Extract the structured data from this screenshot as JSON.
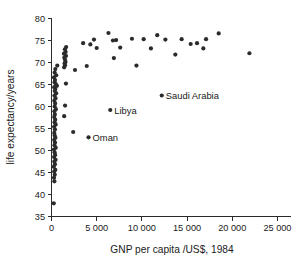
{
  "chart_data": {
    "type": "scatter",
    "title": "",
    "xlabel": "GNP per capita /US$, 1984",
    "ylabel": "life expectancy/years",
    "xlim": [
      0,
      26500
    ],
    "ylim": [
      35,
      80
    ],
    "grid": false,
    "legend": null,
    "xticks": [
      0,
      5000,
      10000,
      15000,
      20000,
      25000
    ],
    "xticklabels": [
      "0",
      "5 000",
      "10 000",
      "15 000",
      "20 000",
      "25 000"
    ],
    "yticks": [
      35,
      40,
      45,
      50,
      55,
      60,
      65,
      70,
      75,
      80
    ],
    "yticklabels": [
      "35",
      "40",
      "45",
      "50",
      "55",
      "60",
      "65",
      "70",
      "75",
      "80"
    ],
    "marker_color": "#2b2b2b",
    "marker_size": 2.1,
    "points": [
      {
        "x": 250,
        "y": 38.0
      },
      {
        "x": 320,
        "y": 43.0
      },
      {
        "x": 280,
        "y": 43.8
      },
      {
        "x": 360,
        "y": 44.5
      },
      {
        "x": 300,
        "y": 45.2
      },
      {
        "x": 420,
        "y": 45.6
      },
      {
        "x": 260,
        "y": 46.3
      },
      {
        "x": 380,
        "y": 46.9
      },
      {
        "x": 310,
        "y": 47.5
      },
      {
        "x": 450,
        "y": 47.9
      },
      {
        "x": 290,
        "y": 48.5
      },
      {
        "x": 400,
        "y": 49.0
      },
      {
        "x": 340,
        "y": 49.6
      },
      {
        "x": 270,
        "y": 50.2
      },
      {
        "x": 470,
        "y": 50.6
      },
      {
        "x": 330,
        "y": 51.2
      },
      {
        "x": 390,
        "y": 51.8
      },
      {
        "x": 300,
        "y": 52.4
      },
      {
        "x": 430,
        "y": 52.9
      },
      {
        "x": 350,
        "y": 53.4
      },
      {
        "x": 2400,
        "y": 54.2
      },
      {
        "x": 310,
        "y": 54.0
      },
      {
        "x": 380,
        "y": 54.8
      },
      {
        "x": 290,
        "y": 55.4
      },
      {
        "x": 460,
        "y": 55.9
      },
      {
        "x": 340,
        "y": 56.4
      },
      {
        "x": 410,
        "y": 57.0
      },
      {
        "x": 300,
        "y": 57.6
      },
      {
        "x": 1400,
        "y": 57.8
      },
      {
        "x": 370,
        "y": 58.2
      },
      {
        "x": 320,
        "y": 58.9
      },
      {
        "x": 480,
        "y": 59.4
      },
      {
        "x": 350,
        "y": 60.0
      },
      {
        "x": 1500,
        "y": 60.2
      },
      {
        "x": 400,
        "y": 60.7
      },
      {
        "x": 310,
        "y": 61.3
      },
      {
        "x": 440,
        "y": 61.9
      },
      {
        "x": 330,
        "y": 62.5
      },
      {
        "x": 520,
        "y": 63.0
      },
      {
        "x": 360,
        "y": 63.5
      },
      {
        "x": 420,
        "y": 64.0
      },
      {
        "x": 300,
        "y": 64.4
      },
      {
        "x": 600,
        "y": 64.7
      },
      {
        "x": 470,
        "y": 65.1
      },
      {
        "x": 340,
        "y": 65.5
      },
      {
        "x": 1600,
        "y": 65.2
      },
      {
        "x": 390,
        "y": 66.0
      },
      {
        "x": 280,
        "y": 66.6
      },
      {
        "x": 520,
        "y": 67.1
      },
      {
        "x": 350,
        "y": 67.7
      },
      {
        "x": 2600,
        "y": 68.3
      },
      {
        "x": 420,
        "y": 68.5
      },
      {
        "x": 1400,
        "y": 68.9
      },
      {
        "x": 1500,
        "y": 69.4
      },
      {
        "x": 1450,
        "y": 69.8
      },
      {
        "x": 1550,
        "y": 70.1
      },
      {
        "x": 640,
        "y": 69.3
      },
      {
        "x": 3900,
        "y": 69.2
      },
      {
        "x": 1500,
        "y": 70.6
      },
      {
        "x": 1420,
        "y": 71.1
      },
      {
        "x": 1600,
        "y": 71.5
      },
      {
        "x": 1380,
        "y": 72.0
      },
      {
        "x": 1560,
        "y": 72.4
      },
      {
        "x": 1480,
        "y": 73.0
      },
      {
        "x": 1620,
        "y": 73.5
      },
      {
        "x": 9400,
        "y": 69.3
      },
      {
        "x": 6900,
        "y": 71.0
      },
      {
        "x": 13700,
        "y": 71.8
      },
      {
        "x": 5000,
        "y": 73.3
      },
      {
        "x": 7600,
        "y": 73.4
      },
      {
        "x": 11000,
        "y": 73.2
      },
      {
        "x": 16800,
        "y": 73.2
      },
      {
        "x": 4300,
        "y": 74.1
      },
      {
        "x": 3500,
        "y": 74.4
      },
      {
        "x": 15400,
        "y": 74.2
      },
      {
        "x": 16100,
        "y": 74.4
      },
      {
        "x": 4700,
        "y": 75.2
      },
      {
        "x": 6800,
        "y": 75.0
      },
      {
        "x": 7150,
        "y": 75.1
      },
      {
        "x": 8900,
        "y": 75.4
      },
      {
        "x": 10200,
        "y": 75.3
      },
      {
        "x": 12600,
        "y": 75.2
      },
      {
        "x": 14400,
        "y": 75.3
      },
      {
        "x": 17100,
        "y": 75.3
      },
      {
        "x": 6300,
        "y": 76.7
      },
      {
        "x": 11700,
        "y": 76.2
      },
      {
        "x": 18500,
        "y": 76.6
      },
      {
        "x": 21900,
        "y": 72.1
      },
      {
        "x": 12200,
        "y": 62.5
      },
      {
        "x": 6500,
        "y": 59.2
      },
      {
        "x": 4100,
        "y": 53.0
      }
    ],
    "annotations": [
      {
        "label": "Saudi Arabia",
        "x": 12200,
        "y": 62.5,
        "dx": 4,
        "dy": 3.5
      },
      {
        "label": "Libya",
        "x": 6500,
        "y": 59.2,
        "dx": 4,
        "dy": 3.5
      },
      {
        "label": "Oman",
        "x": 4100,
        "y": 53.0,
        "dx": 4,
        "dy": 3.5
      }
    ]
  }
}
